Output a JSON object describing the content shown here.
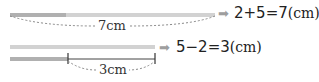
{
  "diagram": {
    "top": {
      "total_label": "7cm",
      "equation": "2+5=7",
      "equation_unit": "(cm)",
      "arrow": "➡"
    },
    "bottom": {
      "difference_label": "3cm",
      "equation": "5−2=3",
      "equation_unit": "(cm)",
      "arrow": "➡"
    },
    "colors": {
      "bar_light": "#cfcfcf",
      "bar_dark": "#a8a8a8",
      "dash": "#8a8a8a",
      "tick": "#333333",
      "arrow": "#9e9e9e",
      "text": "#222222"
    }
  }
}
